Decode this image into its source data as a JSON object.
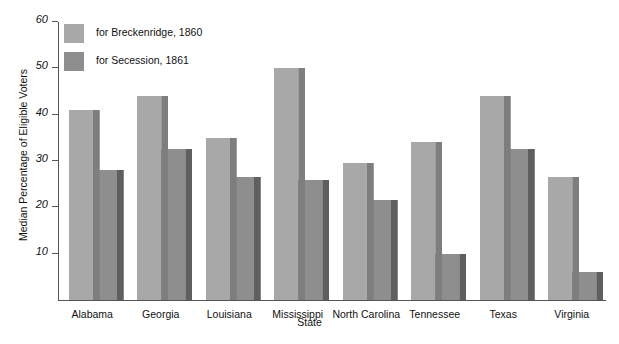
{
  "chart_data": {
    "type": "bar",
    "title": "",
    "xlabel": "State",
    "ylabel": "Median Percentage of Eligible Voters",
    "categories": [
      "Alabama",
      "Georgia",
      "Louisiana",
      "Mississippi",
      "North Carolina",
      "Tennessee",
      "Texas",
      "Virginia"
    ],
    "series": [
      {
        "name": "for Breckenridge, 1860",
        "color": "#a8a8a8",
        "values": [
          41,
          44,
          35,
          50,
          29.5,
          34,
          44,
          26.5
        ]
      },
      {
        "name": "for Secession, 1861",
        "color": "#8e8e8e",
        "values": [
          28,
          32.5,
          26.5,
          26,
          21.5,
          10,
          32.5,
          6
        ]
      }
    ],
    "yticks": [
      10,
      20,
      30,
      40,
      50,
      60
    ],
    "ytick_labels": [
      "10",
      "20",
      "30",
      "40",
      "50",
      "60"
    ],
    "ylim": [
      0,
      60
    ],
    "grid": false,
    "legend_position": "top-left",
    "bar_style": "3d-extruded"
  }
}
